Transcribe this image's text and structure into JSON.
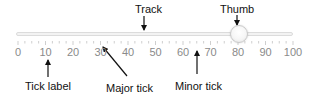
{
  "slider": {
    "min": 0,
    "max": 100,
    "value": 80,
    "major_step": 10,
    "minor_step": 2.5,
    "tick_labels": [
      "0",
      "10",
      "20",
      "30",
      "40",
      "50",
      "60",
      "70",
      "80",
      "90",
      "100"
    ],
    "colors": {
      "track_fill": "#f3f3f3",
      "track_border": "#dcdcdc",
      "tick": "#cfcfcf",
      "tick_label": "#8a8a8a",
      "thumb_border": "#c9c9c9"
    }
  },
  "callouts": {
    "track": "Track",
    "thumb": "Thumb",
    "tick_label": "Tick label",
    "major_tick": "Major tick",
    "minor_tick": "Minor tick"
  }
}
